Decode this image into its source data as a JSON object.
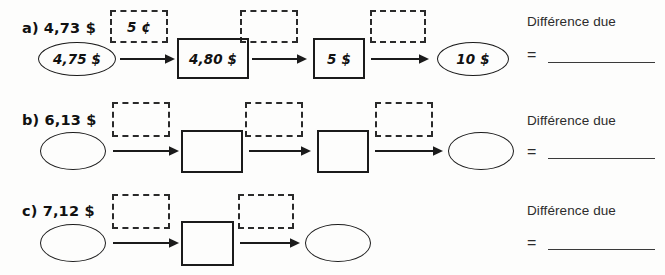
{
  "worksheet": {
    "answer_label": "Différence due",
    "equals_sign": "="
  },
  "rows": [
    {
      "id": "a",
      "letter": "a)",
      "start_amount": "4,73 $",
      "nodes": [
        {
          "shape": "ellipse",
          "value": "4,75 $"
        },
        {
          "shape": "box",
          "value": "4,80 $"
        },
        {
          "shape": "box",
          "value": "5 $"
        },
        {
          "shape": "ellipse",
          "value": "10 $"
        }
      ],
      "steps": [
        {
          "value": "5 ¢"
        },
        {
          "value": ""
        },
        {
          "value": ""
        }
      ],
      "answer_label": "Différence due",
      "answer_value": ""
    },
    {
      "id": "b",
      "letter": "b)",
      "start_amount": "6,13 $",
      "nodes": [
        {
          "shape": "ellipse",
          "value": ""
        },
        {
          "shape": "box",
          "value": ""
        },
        {
          "shape": "box",
          "value": ""
        },
        {
          "shape": "ellipse",
          "value": ""
        }
      ],
      "steps": [
        {
          "value": ""
        },
        {
          "value": ""
        },
        {
          "value": ""
        }
      ],
      "answer_label": "Différence due",
      "answer_value": ""
    },
    {
      "id": "c",
      "letter": "c)",
      "start_amount": "7,12 $",
      "nodes": [
        {
          "shape": "ellipse",
          "value": ""
        },
        {
          "shape": "box",
          "value": ""
        },
        {
          "shape": "ellipse",
          "value": ""
        }
      ],
      "steps": [
        {
          "value": ""
        },
        {
          "value": ""
        }
      ],
      "answer_label": "Différence due",
      "answer_value": ""
    }
  ],
  "colors": {
    "ink": "#1b1b1b",
    "paper": "#fdfdfc",
    "text": "#2c2c2c"
  }
}
